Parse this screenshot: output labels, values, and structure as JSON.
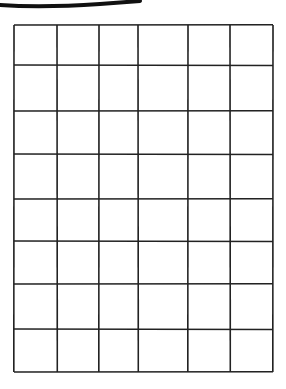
{
  "figure": {
    "stroke_color": "#111111",
    "line_color": "#222222",
    "background": "#ffffff"
  },
  "grid": {
    "rows": 8,
    "columns": 6,
    "column_edges_px": [
      14,
      57,
      99,
      138,
      188,
      230,
      273
    ],
    "row_edges_px": [
      25,
      65,
      111,
      154,
      199,
      241,
      284,
      329,
      372
    ],
    "cells": [
      [
        "",
        "",
        "",
        "",
        "",
        ""
      ],
      [
        "",
        "",
        "",
        "",
        "",
        ""
      ],
      [
        "",
        "",
        "",
        "",
        "",
        ""
      ],
      [
        "",
        "",
        "",
        "",
        "",
        ""
      ],
      [
        "",
        "",
        "",
        "",
        "",
        ""
      ],
      [
        "",
        "",
        "",
        "",
        "",
        ""
      ],
      [
        "",
        "",
        "",
        "",
        "",
        ""
      ],
      [
        "",
        "",
        "",
        "",
        "",
        ""
      ]
    ]
  }
}
